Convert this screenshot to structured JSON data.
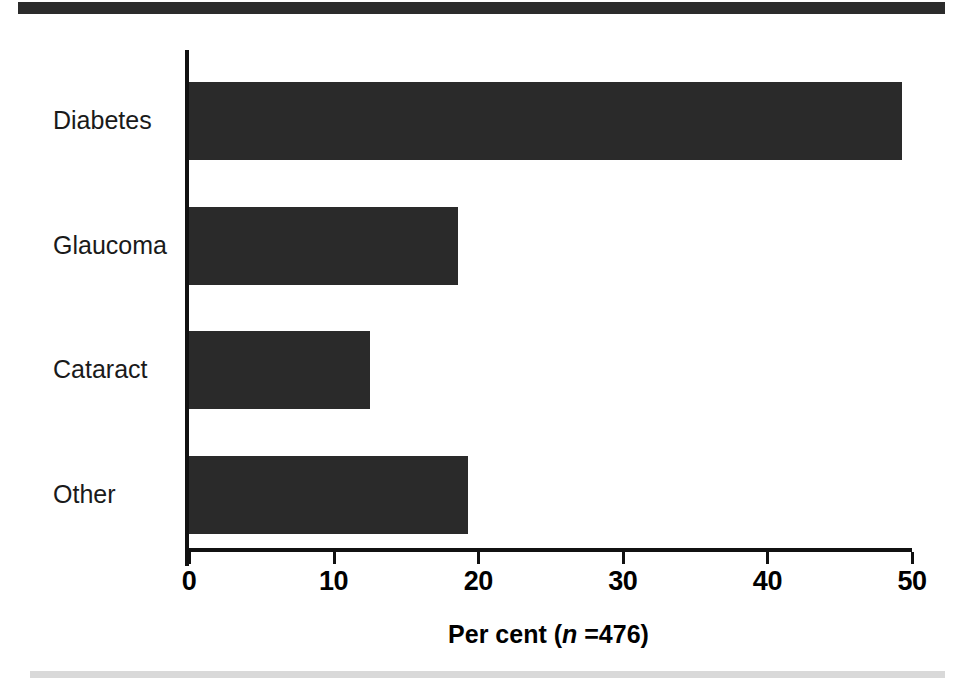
{
  "chart_data": {
    "type": "bar",
    "orientation": "horizontal",
    "title": "",
    "xlabel": "Per cent (n =476)",
    "xlabel_parts": {
      "prefix": "Per cent (",
      "italic": "n",
      "suffix": " =476)"
    },
    "ylabel": "",
    "categories": [
      "Diabetes",
      "Glaucoma",
      "Cataract",
      "Other"
    ],
    "values": [
      49.3,
      18.6,
      12.5,
      19.3
    ],
    "xlim": [
      0,
      50
    ],
    "xticks": [
      0,
      10,
      20,
      30,
      40,
      50
    ],
    "xtick_labels": [
      "0",
      "10",
      "20",
      "30",
      "40",
      "50"
    ],
    "grid": false,
    "legend": null,
    "bar_color": "#2a2a2a",
    "axis_color": "#111111",
    "background_color": "#ffffff",
    "sample_size": 476,
    "units": "per cent"
  },
  "decorations": {
    "top_rule_color": "#2b2b2b",
    "bottom_rule_color": "#d9d9d9"
  }
}
